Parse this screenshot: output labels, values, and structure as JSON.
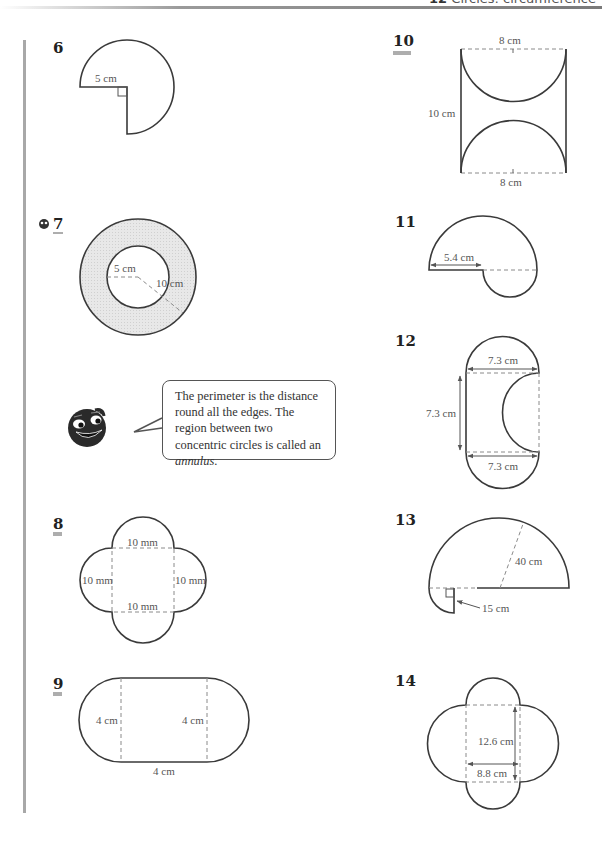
{
  "header": {
    "chapter_number": "12",
    "chapter_title": "Circles: circumference"
  },
  "questions": [
    {
      "number": "6",
      "underline": 0,
      "labels": [
        "5 cm"
      ]
    },
    {
      "number": "7",
      "underline": 1,
      "has_icon": true,
      "labels": [
        "5 cm",
        "10 cm"
      ]
    },
    {
      "number": "8",
      "underline": 2,
      "labels": [
        "10 mm",
        "10 mm",
        "10 mm",
        "10 mm"
      ]
    },
    {
      "number": "9",
      "underline": 2,
      "labels": [
        "4 cm",
        "4 cm",
        "4 cm"
      ]
    },
    {
      "number": "10",
      "underline": 2,
      "labels": [
        "8 cm",
        "10 cm",
        "8 cm"
      ]
    },
    {
      "number": "11",
      "underline": 0,
      "labels": [
        "5.4 cm"
      ]
    },
    {
      "number": "12",
      "underline": 0,
      "labels": [
        "7.3 cm",
        "7.3 cm",
        "7.3 cm"
      ]
    },
    {
      "number": "13",
      "underline": 0,
      "labels": [
        "40 cm",
        "15 cm"
      ]
    },
    {
      "number": "14",
      "underline": 0,
      "labels": [
        "12.6 cm",
        "8.8 cm"
      ]
    }
  ],
  "hint": {
    "text_before": "The perimeter is the distance round all the edges. The region between two concentric circles is called an ",
    "text_italic": "annulus",
    "text_after": "."
  },
  "colors": {
    "line": "#3a3a3a",
    "dashed": "#8a8a8a",
    "label": "#555555",
    "annulus_fill": "#e6e6e6",
    "margin_bar": "#a8a8a8"
  }
}
